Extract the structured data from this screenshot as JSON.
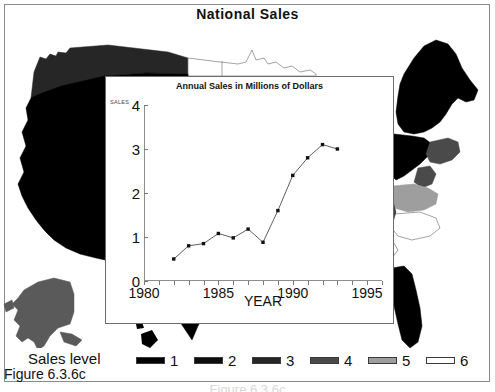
{
  "figure": {
    "title": "National Sales",
    "caption": "Figure 6.3.6c",
    "caption_ghost": "Figure 6.3.6c"
  },
  "legend": {
    "title": "Sales level",
    "items": [
      {
        "label": "1",
        "color": "#000000"
      },
      {
        "label": "2",
        "color": "#0d0d0d"
      },
      {
        "label": "3",
        "color": "#262626"
      },
      {
        "label": "4",
        "color": "#4a4a4a"
      },
      {
        "label": "5",
        "color": "#9e9e9e"
      },
      {
        "label": "6",
        "color": "#ffffff"
      }
    ]
  },
  "map": {
    "name": "united-states-choropleth",
    "regions": [
      {
        "name": "pacific-northwest",
        "level": "3",
        "color": "#262626"
      },
      {
        "name": "california-southwest",
        "level": "1",
        "color": "#000000"
      },
      {
        "name": "northern-plains",
        "level": "6",
        "color": "#ffffff"
      },
      {
        "name": "northeast",
        "level": "1",
        "color": "#000000"
      },
      {
        "name": "mid-atlantic",
        "level": "4",
        "color": "#4a4a4a"
      },
      {
        "name": "virginia",
        "level": "5",
        "color": "#9e9e9e"
      },
      {
        "name": "carolinas",
        "level": "6",
        "color": "#ffffff"
      },
      {
        "name": "florida",
        "level": "1",
        "color": "#000000"
      },
      {
        "name": "texas-south",
        "level": "1",
        "color": "#000000"
      },
      {
        "name": "alaska",
        "level": "4",
        "color": "#5a5a5a"
      },
      {
        "name": "hawaii",
        "level": "1",
        "color": "#000000"
      }
    ]
  },
  "chart_data": {
    "type": "line",
    "title": "Annual Sales in Millions of Dollars",
    "xlabel": "YEAR",
    "ylabel": "SALES",
    "xlim": [
      1980,
      1996
    ],
    "ylim": [
      0,
      4
    ],
    "grid": false,
    "legend": "none",
    "xticks": [
      1980,
      1985,
      1990,
      1995
    ],
    "xtick_labels": [
      "1980",
      "1985",
      "1990",
      "1995"
    ],
    "xminor": [
      1981,
      1982,
      1983,
      1984,
      1986,
      1987,
      1988,
      1989,
      1991,
      1992,
      1993,
      1994,
      1996
    ],
    "yticks": [
      0,
      1,
      2,
      3,
      4
    ],
    "ytick_labels": [
      "0",
      "1",
      "2",
      "3",
      "4"
    ],
    "x": [
      1982,
      1983,
      1984,
      1985,
      1986,
      1987,
      1988,
      1989,
      1990,
      1991,
      1992,
      1993
    ],
    "values": [
      0.5,
      0.8,
      0.85,
      1.08,
      0.98,
      1.18,
      0.88,
      1.6,
      2.4,
      2.8,
      3.1,
      3.0
    ],
    "marker": "square",
    "line_color": "#4d4d4d",
    "marker_color": "#111111"
  }
}
